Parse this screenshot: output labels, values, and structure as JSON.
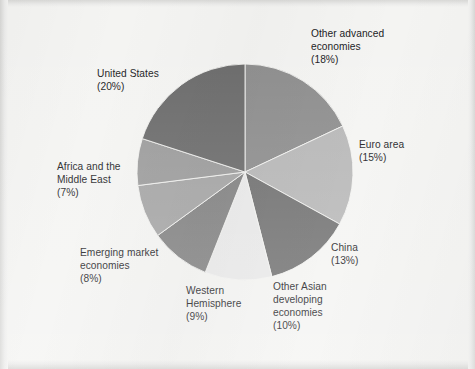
{
  "figure": {
    "background_color": "#f4f4f2",
    "label_text_color": "#17171a"
  },
  "chart_data": {
    "type": "pie",
    "title": "",
    "subtitle": "",
    "xlabel": "",
    "ylabel": "",
    "grid": false,
    "legend_position": "none",
    "labels_outside": true,
    "start_angle_deg": 0,
    "direction": "clockwise",
    "total_percent": 100,
    "categories": [
      "Other advanced economies",
      "Euro area",
      "China",
      "Other Asian developing economies",
      "Western Hemisphere",
      "Emerging market economies",
      "Africa and the Middle East",
      "United States"
    ],
    "values": [
      18,
      15,
      13,
      10,
      9,
      8,
      7,
      20
    ],
    "value_suffix": "%",
    "colors": [
      "#8c8c8c",
      "#b6b6b6",
      "#6e6e6e",
      "#e9e9e9",
      "#7f7f7f",
      "#a3a3a3",
      "#9a9a9a",
      "#696969"
    ],
    "slices": [
      {
        "name": "Other advanced economies",
        "value": 18,
        "label_lines": [
          "Other advanced",
          "economies",
          "(18%)"
        ],
        "color": "#8c8c8c"
      },
      {
        "name": "Euro area",
        "value": 15,
        "label_lines": [
          "Euro area",
          "(15%)"
        ],
        "color": "#b6b6b6"
      },
      {
        "name": "China",
        "value": 13,
        "label_lines": [
          "China",
          "(13%)"
        ],
        "color": "#6e6e6e"
      },
      {
        "name": "Other Asian developing economies",
        "value": 10,
        "label_lines": [
          "Other Asian",
          "developing",
          "economies",
          "(10%)"
        ],
        "color": "#e9e9e9"
      },
      {
        "name": "Western Hemisphere",
        "value": 9,
        "label_lines": [
          "Western",
          "Hemisphere",
          "(9%)"
        ],
        "color": "#7f7f7f"
      },
      {
        "name": "Emerging market economies",
        "value": 8,
        "label_lines": [
          "Emerging market",
          "economies",
          "(8%)"
        ],
        "color": "#a3a3a3"
      },
      {
        "name": "Africa and the Middle East",
        "value": 7,
        "label_lines": [
          "Africa and the",
          "Middle East",
          "(7%)"
        ],
        "color": "#9a9a9a"
      },
      {
        "name": "United States",
        "value": 20,
        "label_lines": [
          "United States",
          "(20%)"
        ],
        "color": "#696969"
      }
    ]
  },
  "labels": {
    "other_advanced": "Other advanced\neconomies\n(18%)",
    "euro_area": "Euro area\n(15%)",
    "china": "China\n(13%)",
    "other_asian": "Other Asian\ndeveloping\neconomies\n(10%)",
    "western_hemisphere": "Western\nHemisphere\n(9%)",
    "emerging_market": "Emerging market\neconomies\n(8%)",
    "africa_middle_east": "Africa and the\nMiddle East\n(7%)",
    "united_states": "United States\n(20%)"
  }
}
